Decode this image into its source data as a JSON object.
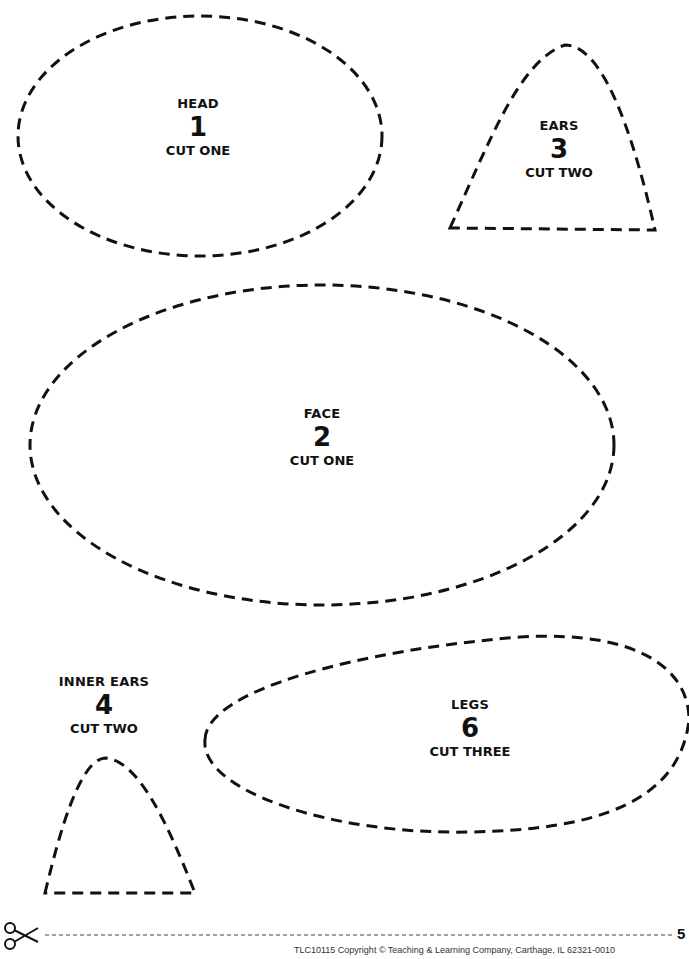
{
  "pieces": [
    {
      "name": "HEAD",
      "number": "1",
      "instruction": "CUT ONE"
    },
    {
      "name": "FACE",
      "number": "2",
      "instruction": "CUT ONE"
    },
    {
      "name": "EARS",
      "number": "3",
      "instruction": "CUT TWO"
    },
    {
      "name": "INNER EARS",
      "number": "4",
      "instruction": "CUT TWO"
    },
    {
      "name": "LEGS",
      "number": "6",
      "instruction": "CUT THREE"
    }
  ],
  "footer": {
    "copyright": "TLC10115 Copyright © Teaching & Learning Company, Carthage, IL  62321-0010",
    "page_number": "5",
    "scissors_icon": "scissors-icon"
  }
}
